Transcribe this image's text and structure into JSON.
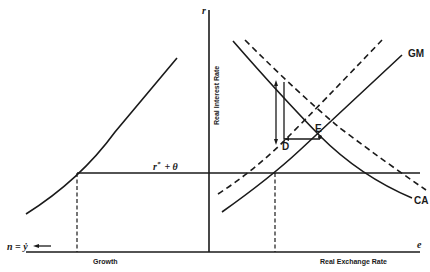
{
  "diagram": {
    "type": "economic-two-panel-diagram",
    "left_panel": {
      "x_axis_label": "Growth",
      "origin_label": "n = ẏ",
      "curve": "growth-rate vs real interest rate (upward convex)"
    },
    "right_panel": {
      "y_axis_symbol": "r",
      "y_axis_label": "Real Interest Rate",
      "x_axis_symbol": "e",
      "x_axis_label": "Real Exchange Rate",
      "curves": [
        {
          "name": "GM",
          "style": "solid",
          "slope": "upward"
        },
        {
          "name": "GM-shifted",
          "style": "dashed",
          "slope": "upward"
        },
        {
          "name": "CA",
          "style": "solid",
          "slope": "downward"
        },
        {
          "name": "CA-shifted",
          "style": "dashed",
          "slope": "downward"
        }
      ],
      "points": [
        {
          "name": "E",
          "label": "E"
        },
        {
          "name": "D",
          "label": "D"
        }
      ]
    },
    "horizontal_line_label_main": "r",
    "horizontal_line_label_sup": "*",
    "horizontal_line_label_rest": "+ θ"
  },
  "colors": {
    "ink": "#1a1a1a",
    "background": "#ffffff"
  }
}
